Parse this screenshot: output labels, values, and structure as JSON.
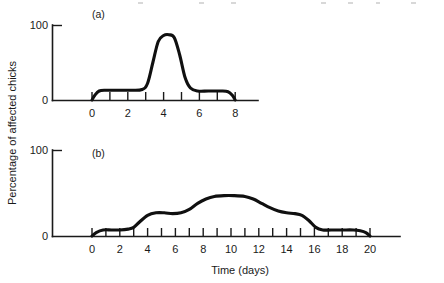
{
  "figure": {
    "background_color": "#ffffff",
    "line_color": "#101010",
    "axis_color": "#1a1a1a",
    "width": 444,
    "height": 283,
    "y_axis_title": "Percentage of affected chicks",
    "x_axis_title": "Time (days)"
  },
  "panel_a": {
    "label": "(a)",
    "y_ticks": [
      "0",
      "100"
    ],
    "x_ticks": [
      "0",
      "2",
      "4",
      "6",
      "8"
    ]
  },
  "panel_b": {
    "label": "(b)",
    "y_ticks": [
      "0",
      "100"
    ],
    "x_ticks": [
      "0",
      "2",
      "4",
      "6",
      "8",
      "10",
      "12",
      "14",
      "16",
      "18",
      "20"
    ]
  },
  "chart_data": {
    "type": "line",
    "title": "",
    "xlabel": "Time (days)",
    "ylabel": "Percentage of affected chicks",
    "panels": [
      {
        "id": "a",
        "label": "(a)",
        "xlim": [
          0,
          8
        ],
        "ylim": [
          0,
          100
        ],
        "xticks": [
          0,
          1,
          2,
          3,
          4,
          5,
          6,
          7,
          8
        ],
        "xticklabels": [
          "0",
          "",
          "2",
          "",
          "4",
          "",
          "6",
          "",
          "8"
        ],
        "yticks": [
          0,
          100
        ],
        "yticklabels": [
          "0",
          "100"
        ],
        "grid": false,
        "legend": "none",
        "series": [
          {
            "name": "affected chicks",
            "x": [
              0.0,
              0.15,
              0.4,
              0.8,
              1.5,
              2.2,
              2.8,
              3.1,
              3.4,
              3.7,
              4.0,
              4.3,
              4.6,
              4.9,
              5.2,
              5.5,
              5.9,
              6.5,
              7.2,
              7.6,
              7.85,
              8.0
            ],
            "y": [
              0,
              6,
              12,
              13,
              13,
              13,
              14,
              22,
              50,
              78,
              86,
              87,
              83,
              60,
              30,
              16,
              12,
              12,
              12,
              11,
              6,
              0
            ]
          }
        ]
      },
      {
        "id": "b",
        "label": "(b)",
        "xlim": [
          0,
          20
        ],
        "ylim": [
          0,
          100
        ],
        "xticks": [
          0,
          1,
          2,
          3,
          4,
          5,
          6,
          7,
          8,
          9,
          10,
          11,
          12,
          13,
          14,
          15,
          16,
          17,
          18,
          19,
          20
        ],
        "xticklabels": [
          "0",
          "",
          "2",
          "",
          "4",
          "",
          "6",
          "",
          "8",
          "",
          "10",
          "",
          "12",
          "",
          "14",
          "",
          "16",
          "",
          "18",
          "",
          "20"
        ],
        "yticks": [
          0,
          100
        ],
        "yticklabels": [
          "0",
          "100"
        ],
        "grid": false,
        "legend": "none",
        "series": [
          {
            "name": "affected chicks",
            "x": [
              0.0,
              0.3,
              0.8,
              1.4,
              2.0,
              2.6,
              3.0,
              3.4,
              4.0,
              4.6,
              5.2,
              5.8,
              6.4,
              7.0,
              7.6,
              8.2,
              8.8,
              9.5,
              10.2,
              11.0,
              11.6,
              12.2,
              12.8,
              13.4,
              14.0,
              14.6,
              15.1,
              15.6,
              16.1,
              16.6,
              17.2,
              18.0,
              18.8,
              19.3,
              19.7,
              20.0
            ],
            "y": [
              0,
              4,
              7,
              7,
              7,
              8,
              10,
              16,
              24,
              27,
              27,
              26,
              27,
              31,
              38,
              43,
              46,
              47,
              47,
              46,
              43,
              38,
              33,
              29,
              27,
              26,
              24,
              18,
              10,
              7,
              7,
              7,
              7,
              6,
              4,
              0
            ]
          }
        ]
      }
    ]
  }
}
